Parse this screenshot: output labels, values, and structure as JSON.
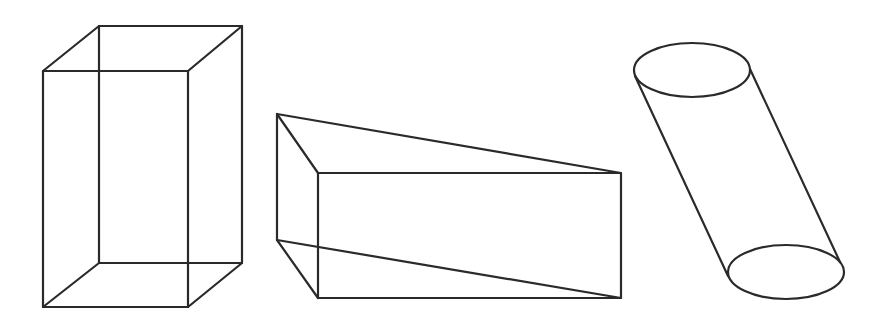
{
  "diagram": {
    "stroke_color": "#2a2a2a",
    "background": "#ffffff",
    "shapes": [
      {
        "name": "rectangular-prism",
        "type": "cuboid",
        "vertices": {
          "front_top_left": [
            43,
            71
          ],
          "front_top_right": [
            188,
            71
          ],
          "front_bottom_left": [
            43,
            307
          ],
          "front_bottom_right": [
            188,
            307
          ],
          "back_top_left": [
            99,
            26
          ],
          "back_top_right": [
            242,
            26
          ],
          "back_bottom_left": [
            99,
            263
          ],
          "back_bottom_right": [
            242,
            263
          ]
        }
      },
      {
        "name": "triangular-prism",
        "type": "triangular-prism",
        "vertices": {
          "apex_top": [
            277,
            114
          ],
          "apex_bottom": [
            277,
            240
          ],
          "face_top_left": [
            318,
            173
          ],
          "face_top_right": [
            621,
            173
          ],
          "face_bottom_left": [
            318,
            298
          ],
          "face_bottom_right": [
            621,
            298
          ]
        }
      },
      {
        "name": "oblique-cylinder",
        "type": "cylinder",
        "top_ellipse": {
          "cx": 692,
          "cy": 70,
          "rx": 58,
          "ry": 27
        },
        "bottom_ellipse": {
          "cx": 786,
          "cy": 272,
          "rx": 58,
          "ry": 27
        },
        "left_side": [
          [
            635,
            76
          ],
          [
            728,
            276
          ]
        ],
        "right_side": [
          [
            750,
            69
          ],
          [
            840,
            262
          ]
        ]
      }
    ]
  }
}
